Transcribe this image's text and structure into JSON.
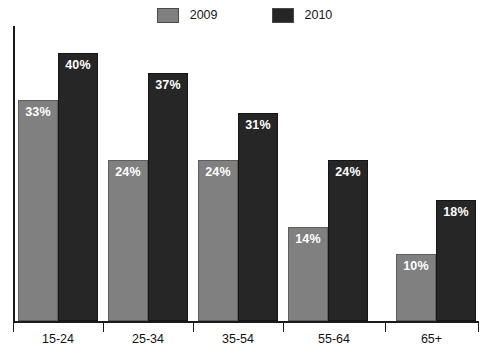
{
  "chart_data": {
    "type": "bar",
    "title": "",
    "title_clipped": true,
    "xlabel": "",
    "ylabel": "",
    "ylim": [
      0,
      44
    ],
    "grid": false,
    "legend_position": "top-center",
    "categories": [
      "15-24",
      "25-34",
      "35-54",
      "55-64",
      "65+"
    ],
    "series": [
      {
        "name": "2009",
        "color": "#808080",
        "values": [
          33,
          24,
          24,
          14,
          10
        ],
        "labels": [
          "33%",
          "24%",
          "24%",
          "14%",
          "10%"
        ]
      },
      {
        "name": "2010",
        "color": "#262626",
        "values": [
          40,
          37,
          31,
          24,
          18
        ],
        "labels": [
          "40%",
          "37%",
          "31%",
          "24%",
          "18%"
        ]
      }
    ]
  },
  "legend": {
    "items": [
      {
        "label": "2009",
        "color": "#808080"
      },
      {
        "label": "2010",
        "color": "#262626"
      }
    ]
  },
  "axis": {
    "line_color": "#1a1a1a"
  }
}
